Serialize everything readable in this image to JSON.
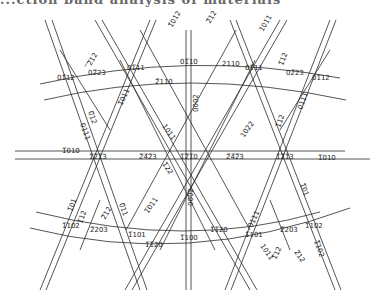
{
  "header": {
    "text": "...ction band analysis of materials"
  },
  "diagram": {
    "type": "kikuchi-map",
    "line_color": "#2a2a2a",
    "background": "#ffffff",
    "poles": [
      {
        "id": "p1210",
        "label": "1̅2̅1̅0",
        "x": 188,
        "y": 156
      },
      {
        "id": "p1213l",
        "label": "1̅2̅1̅3",
        "x": 97,
        "y": 156
      },
      {
        "id": "p1213r",
        "label": "1̅2̅1̅3",
        "x": 284,
        "y": 156
      },
      {
        "id": "p2423l",
        "label": "2̅4̅2̅3",
        "x": 148,
        "y": 156
      },
      {
        "id": "p2423r",
        "label": "2̅4̅2̅3",
        "x": 235,
        "y": 156
      },
      {
        "id": "p0110",
        "label": "01̅10",
        "x": 188,
        "y": 64
      },
      {
        "id": "p0111l",
        "label": "01̅11",
        "x": 135,
        "y": 66
      },
      {
        "id": "p0111r",
        "label": "01̅11",
        "x": 243,
        "y": 66
      },
      {
        "id": "p0112l",
        "label": "01̅12",
        "x": 70,
        "y": 78
      },
      {
        "id": "p0112r",
        "label": "01̅12",
        "x": 310,
        "y": 78
      },
      {
        "id": "p0223l",
        "label": "02̅23",
        "x": 95,
        "y": 72
      },
      {
        "id": "p0223r",
        "label": "02̅23",
        "x": 288,
        "y": 72
      },
      {
        "id": "p1100",
        "label": "1̅100",
        "x": 188,
        "y": 235
      },
      {
        "id": "p1101l",
        "label": "1̅101",
        "x": 132,
        "y": 233
      },
      {
        "id": "p1101r",
        "label": "1̅101",
        "x": 245,
        "y": 233
      },
      {
        "id": "p1102l",
        "label": "1̅102",
        "x": 72,
        "y": 225
      },
      {
        "id": "p1102r",
        "label": "1̅102",
        "x": 310,
        "y": 225
      },
      {
        "id": "p2203l",
        "label": "2̅203",
        "x": 100,
        "y": 232
      },
      {
        "id": "p2203r",
        "label": "2̅203",
        "x": 284,
        "y": 232
      }
    ],
    "zone_labels": [
      {
        "label": "2̅110",
        "x": 165,
        "y": 81,
        "rot": 0
      },
      {
        "label": "2110",
        "x": 222,
        "y": 64,
        "rot": 0
      },
      {
        "label": "1̅010",
        "x": 70,
        "y": 153,
        "rot": 0
      },
      {
        "label": "1̅010",
        "x": 320,
        "y": 158,
        "rot": 0
      },
      {
        "label": "1̅1̅20",
        "x": 215,
        "y": 230,
        "rot": 0
      },
      {
        "label": "1̅1̅20",
        "x": 152,
        "y": 244,
        "rot": 0
      },
      {
        "label": "0002",
        "x": 197,
        "y": 106,
        "rot": -90
      },
      {
        "label": "0002",
        "x": 192,
        "y": 200,
        "rot": -90
      },
      {
        "label": "1̅012",
        "x": 176,
        "y": 22,
        "rot": -60
      },
      {
        "label": "2̅12",
        "x": 213,
        "y": 18,
        "rot": -60
      },
      {
        "label": "̅2̅12",
        "x": 94,
        "y": 60,
        "rot": -60
      },
      {
        "label": "1011",
        "x": 267,
        "y": 26,
        "rot": -60
      },
      {
        "label": "1̅12",
        "x": 285,
        "y": 60,
        "rot": -70
      },
      {
        "label": "0111",
        "x": 85,
        "y": 130,
        "rot": 70
      },
      {
        "label": "0̅12",
        "x": 93,
        "y": 118,
        "rot": 70
      },
      {
        "label": "1̅011",
        "x": 125,
        "y": 100,
        "rot": -65
      },
      {
        "label": "1011",
        "x": 166,
        "y": 130,
        "rot": 55
      },
      {
        "label": "1̅22",
        "x": 167,
        "y": 168,
        "rot": 55
      },
      {
        "label": "1022",
        "x": 247,
        "y": 133,
        "rot": -55
      },
      {
        "label": "1̅12",
        "x": 282,
        "y": 123,
        "rot": -70
      },
      {
        "label": "0111",
        "x": 305,
        "y": 103,
        "rot": -70
      },
      {
        "label": "1̅01",
        "x": 74,
        "y": 205,
        "rot": -70
      },
      {
        "label": "1̅12",
        "x": 84,
        "y": 217,
        "rot": -70
      },
      {
        "label": "2̅12",
        "x": 108,
        "y": 214,
        "rot": -60
      },
      {
        "label": "0̅11",
        "x": 123,
        "y": 210,
        "rot": 70
      },
      {
        "label": "1̅011",
        "x": 152,
        "y": 208,
        "rot": -55
      },
      {
        "label": "0111",
        "x": 255,
        "y": 222,
        "rot": -65
      },
      {
        "label": "1̅01",
        "x": 305,
        "y": 190,
        "rot": 70
      },
      {
        "label": "1011",
        "x": 265,
        "y": 251,
        "rot": 55
      },
      {
        "label": "1̅12",
        "x": 279,
        "y": 254,
        "rot": -65
      },
      {
        "label": "2̅12",
        "x": 298,
        "y": 258,
        "rot": 55
      },
      {
        "label": "1̅102",
        "x": 318,
        "y": 247,
        "rot": 70
      }
    ]
  }
}
